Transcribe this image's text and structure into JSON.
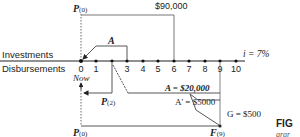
{
  "diagram": {
    "row_labels": {
      "investments": "Investments",
      "disbursements": "Disbursements"
    },
    "periods": [
      "0",
      "1",
      "2",
      "3",
      "4",
      "5",
      "6",
      "7",
      "8",
      "9",
      "10"
    ],
    "interest": "i = 7%",
    "now_label": "Now",
    "top": {
      "p0_label": "P",
      "p0_sub": "(0)",
      "amount_90000": "$90,000",
      "a_label": "A"
    },
    "bottom": {
      "p2_label": "P",
      "p2_sub": "(2)",
      "a_20000": "A = $20,000",
      "a_prime": "A' = $5000",
      "g_label": "G = $500",
      "p0_label": "P",
      "p0_sub": "(0)",
      "f9_label": "F",
      "f9_sub": "(9)"
    },
    "caption_fragment": {
      "line1": "FIG",
      "line2": "grar"
    }
  }
}
